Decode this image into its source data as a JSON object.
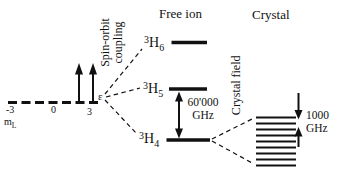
{
  "headers": {
    "free_ion": "Free ion",
    "crystal": "Crystal"
  },
  "rotated_labels": {
    "spin_orbit_line1": "Spin-orbit",
    "spin_orbit_line2": "coupling",
    "crystal_field": "Crystal field"
  },
  "ml_axis": {
    "symbol": "m",
    "symbol_sub": "L",
    "ticks": [
      "-3",
      "0",
      "3"
    ]
  },
  "levels": [
    {
      "name": "3H6",
      "sup": "3",
      "letter": "H",
      "sub": "6"
    },
    {
      "name": "3H5",
      "sup": "3",
      "letter": "H",
      "sub": "5"
    },
    {
      "name": "3H4",
      "sup": "3",
      "letter": "H",
      "sub": "4"
    }
  ],
  "annotations": {
    "spin_orbit_splitting_value": "60'000",
    "spin_orbit_splitting_unit": "GHz",
    "crystal_field_splitting_value": "1000",
    "crystal_field_splitting_unit": "GHz",
    "fan_brace": "ε"
  },
  "colors": {
    "ink": "#111111",
    "background": "#ffffff"
  }
}
